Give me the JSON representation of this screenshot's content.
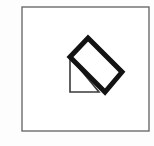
{
  "canvas": {
    "width": 154,
    "height": 146,
    "background_color": "#fdfdfd",
    "label": "geometric-figure-panel"
  },
  "frame": {
    "name": "outer-frame",
    "x": 22,
    "y": 7,
    "width": 127,
    "height": 124,
    "stroke_color": "#6b6b6b",
    "stroke_width": 1.4,
    "fill_color": "#ffffff"
  },
  "figure": {
    "quadrilateral": {
      "name": "tilted-rectangle",
      "points": "88,38 122,72 105,92 70,57",
      "fill_color": "#ffffff",
      "stroke_color": "#131313",
      "stroke_width": 5.0
    },
    "triangle": {
      "name": "hatched-right-triangle",
      "points": "70,57 99,92 70,92",
      "fill_color": "#ffffff",
      "hatch_color": "#4a4a4a",
      "hatch_spacing": 3,
      "hatch_angle_deg": 45,
      "stroke_color": "#3a3a3a",
      "stroke_width": 1.6
    }
  },
  "hatch": {
    "pattern_name": "diagonal-hatch-pattern",
    "line_width": 1.0,
    "line_color": "#4f4f4f"
  }
}
